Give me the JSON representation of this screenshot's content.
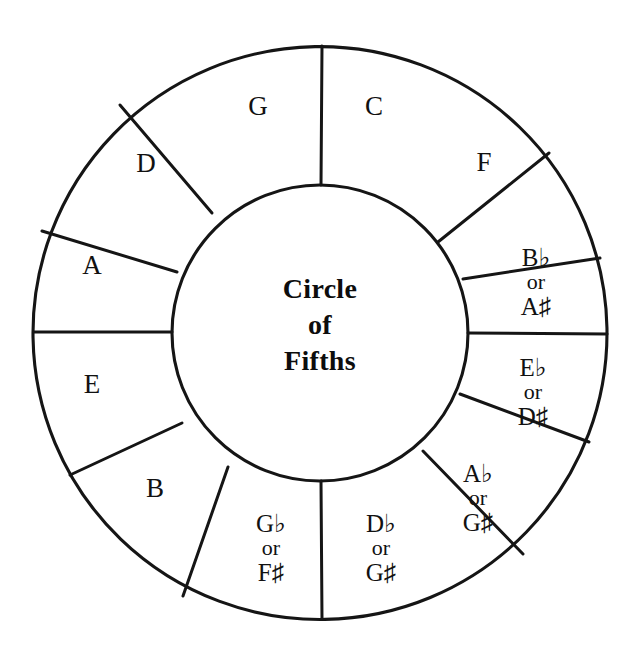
{
  "diagram": {
    "title_lines": [
      "Circle",
      "of",
      "Fifths"
    ],
    "center_title_full": "Circle of Fifths",
    "stroke_color": "#151515",
    "background_color": "#ffffff",
    "text_color": "#111111",
    "geometry": {
      "center_x": 320,
      "center_y": 333,
      "outer_radius": 287,
      "inner_radius": 148,
      "segment_count": 12
    },
    "segments": [
      {
        "id": "c",
        "type": "single",
        "lines": [
          "C"
        ],
        "note": "C",
        "label_x": 374,
        "label_y": 106
      },
      {
        "id": "f",
        "type": "single",
        "lines": [
          "F"
        ],
        "note": "F",
        "label_x": 484,
        "label_y": 162
      },
      {
        "id": "b-flat",
        "type": "triple",
        "lines": [
          "B♭",
          "or",
          "A♯"
        ],
        "note": "B-flat or A-sharp",
        "label_x": 536,
        "label_y": 282
      },
      {
        "id": "e-flat",
        "type": "triple",
        "lines": [
          "E♭",
          "or",
          "D♯"
        ],
        "note": "E-flat or D-sharp",
        "label_x": 533,
        "label_y": 392
      },
      {
        "id": "a-flat",
        "type": "triple",
        "lines": [
          "A♭",
          "or",
          "G♯"
        ],
        "note": "A-flat or G-sharp",
        "label_x": 478,
        "label_y": 498
      },
      {
        "id": "d-flat",
        "type": "triple",
        "lines": [
          "D♭",
          "or",
          "G♯"
        ],
        "note": "D-flat or G-sharp",
        "label_x": 381,
        "label_y": 548
      },
      {
        "id": "g-flat",
        "type": "triple",
        "lines": [
          "G♭",
          "or",
          "F♯"
        ],
        "note": "G-flat or F-sharp",
        "label_x": 271,
        "label_y": 548
      },
      {
        "id": "b",
        "type": "single",
        "lines": [
          "B"
        ],
        "note": "B",
        "label_x": 155,
        "label_y": 488
      },
      {
        "id": "e",
        "type": "single",
        "lines": [
          "E"
        ],
        "note": "E",
        "label_x": 92,
        "label_y": 384
      },
      {
        "id": "a",
        "type": "single",
        "lines": [
          "A"
        ],
        "note": "A",
        "label_x": 92,
        "label_y": 265
      },
      {
        "id": "d",
        "type": "single",
        "lines": [
          "D"
        ],
        "note": "D",
        "label_x": 146,
        "label_y": 163
      },
      {
        "id": "g",
        "type": "single",
        "lines": [
          "G"
        ],
        "note": "G",
        "label_x": 258,
        "label_y": 106
      }
    ],
    "spoke_angles_deg": [
      270,
      305,
      339,
      372,
      400,
      437,
      473,
      505,
      540,
      576,
      610,
      643
    ]
  }
}
